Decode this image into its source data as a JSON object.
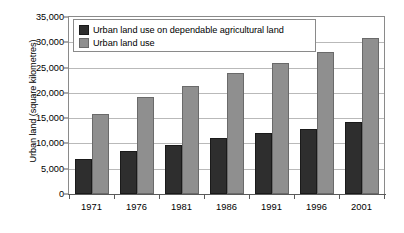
{
  "chart_data": {
    "type": "bar",
    "title": "",
    "xlabel": "",
    "ylabel": "Urban land (square kilometres)",
    "categories": [
      "1971",
      "1976",
      "1981",
      "1986",
      "1991",
      "1996",
      "2001"
    ],
    "series": [
      {
        "name": "Urban land use on dependable agricultural land",
        "color": "#2e2e2e",
        "values": [
          6900,
          8600,
          9700,
          11100,
          12000,
          12900,
          14300
        ]
      },
      {
        "name": "Urban land use",
        "color": "#8f8f8f",
        "values": [
          15800,
          19200,
          21400,
          24000,
          26000,
          28000,
          30800
        ]
      }
    ],
    "ylim": [
      0,
      35000
    ],
    "ytick_values": [
      0,
      5000,
      10000,
      15000,
      20000,
      25000,
      30000,
      35000
    ],
    "ytick_labels": [
      "0",
      "5,000",
      "10,000",
      "15,000",
      "20,000",
      "25,000",
      "30,000",
      "35,000"
    ],
    "grid": true,
    "legend_position": "top-left"
  },
  "legend": {
    "entries": [
      {
        "label": "Urban land use on dependable agricultural land",
        "swatch": "dark"
      },
      {
        "label": "Urban land use",
        "swatch": "gray"
      }
    ]
  },
  "colors": {
    "series_dark": "#2e2e2e",
    "series_gray": "#8f8f8f",
    "gridline": "#b9b9b9",
    "axis": "#5a5a5a",
    "frame": "#8a8a8a",
    "background": "#ffffff",
    "text": "#000000"
  }
}
